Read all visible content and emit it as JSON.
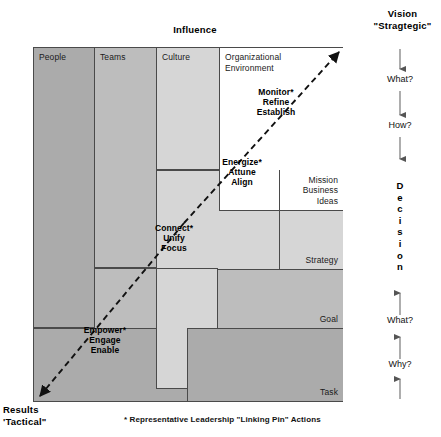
{
  "diagram": {
    "title_top": "Influence",
    "top_right": {
      "title": "Vision",
      "subtitle": "\"Stragtegic\""
    },
    "bottom_left": {
      "title": "Results",
      "subtitle": "'Tactical\""
    },
    "footnote": "* Representative Leadership \"Linking Pin\" Actions",
    "columns": [
      {
        "id": "people",
        "label": "People",
        "color": "#ababab"
      },
      {
        "id": "teams",
        "label": "Teams",
        "color": "#bdbdbd"
      },
      {
        "id": "culture",
        "label": "Culture",
        "color": "#d6d6d6"
      },
      {
        "id": "org-env",
        "label": "Organizational\nEnvironment",
        "color": "#ffffff"
      }
    ],
    "rows": [
      {
        "id": "mission",
        "label": "Mission\nBusiness Ideas"
      },
      {
        "id": "strategy",
        "label": "Strategy"
      },
      {
        "id": "goal",
        "label": "Goal"
      },
      {
        "id": "task",
        "label": "Task"
      }
    ],
    "linking_pins": [
      {
        "id": "monitor",
        "text": "Monitor*\nRefine\nEstablish"
      },
      {
        "id": "energize",
        "text": "Energize*\nAttune\nAlign"
      },
      {
        "id": "connect",
        "text": "Connect*\nUnify\nFocus"
      },
      {
        "id": "empower",
        "text": "Empower*\nEngage\nEnable"
      }
    ],
    "rail": {
      "down_labels": [
        "What?",
        "How?"
      ],
      "center_word": "Decision",
      "center_letters": [
        "D",
        "e",
        "c",
        "i",
        "s",
        "i",
        "o",
        "n"
      ],
      "up_labels": [
        "What?",
        "Why?"
      ]
    },
    "colors": {
      "dark_gray": "#ababab",
      "mid_gray": "#bdbdbd",
      "light_gray": "#d6d6d6",
      "white": "#ffffff",
      "stroke": "#4a4a4a",
      "outline": "#1a1a1a"
    }
  }
}
